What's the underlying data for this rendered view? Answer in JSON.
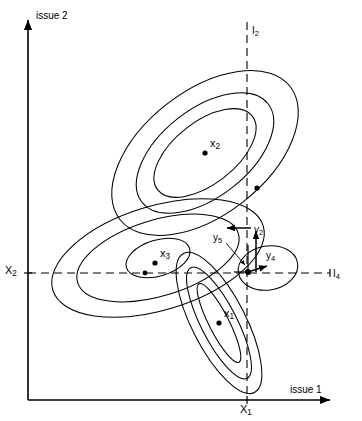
{
  "figure": {
    "background": "#ffffff",
    "ink": "#000000",
    "width": 362,
    "height": 421
  },
  "axes": {
    "x_label": "issue 1",
    "y_label": "issue 2",
    "x_axis_y": 400,
    "y_axis_x": 28,
    "origin": [
      28,
      400
    ],
    "x_arrow_end": [
      335,
      400
    ],
    "y_arrow_top": [
      28,
      15
    ]
  },
  "ticks": [
    {
      "name": "x1-tick",
      "label": "X",
      "sub": "1",
      "axis": "x",
      "pos": [
        247,
        400
      ]
    },
    {
      "name": "x2-tick",
      "label": "X",
      "sub": "2",
      "axis": "y",
      "pos": [
        28,
        273
      ]
    }
  ],
  "reference_lines": [
    {
      "name": "I2",
      "label": "I",
      "sub": "2",
      "orientation": "vertical",
      "x": 247,
      "y_from": 22,
      "y_to": 395,
      "style": "dashed",
      "label_pos": [
        253,
        30
      ]
    },
    {
      "name": "I4",
      "label": "I",
      "sub": "4",
      "orientation": "horizontal",
      "y": 273,
      "x_from": 28,
      "x_to": 330,
      "style": "dashed",
      "label_pos": [
        324,
        276
      ]
    }
  ],
  "points": [
    {
      "name": "x1",
      "label": "x",
      "sub": "1",
      "cx": 219,
      "cy": 323,
      "label_pos": [
        224,
        312
      ]
    },
    {
      "name": "x2",
      "label": "x",
      "sub": "2",
      "cx": 205,
      "cy": 153,
      "label_pos": [
        210,
        142
      ]
    },
    {
      "name": "x3",
      "label": "x",
      "sub": "3",
      "cx": 155,
      "cy": 263,
      "label_pos": [
        160,
        252
      ]
    },
    {
      "name": "node-upper-dash",
      "label": "",
      "sub": "",
      "cx": 257,
      "cy": 188,
      "label_pos": [
        0,
        0
      ]
    },
    {
      "name": "node-x3-on-I4",
      "label": "",
      "sub": "",
      "cx": 145,
      "cy": 273,
      "label_pos": [
        0,
        0
      ]
    },
    {
      "name": "node-center",
      "label": "",
      "sub": "",
      "cx": 248,
      "cy": 272,
      "label_pos": [
        0,
        0
      ]
    }
  ],
  "vectors": [
    {
      "name": "y2",
      "label": "y",
      "sub": "2",
      "from": [
        251,
        228
      ],
      "to": [
        228,
        228
      ],
      "label_pos": [
        255,
        228
      ]
    },
    {
      "name": "y4",
      "label": "y",
      "sub": "4",
      "from": [
        248,
        272
      ],
      "to": [
        268,
        266
      ],
      "label_pos": [
        268,
        258
      ]
    },
    {
      "name": "y5",
      "label": "y",
      "sub": "5",
      "from": [
        228,
        240
      ],
      "to": [
        246,
        264
      ],
      "label_pos": [
        220,
        240
      ]
    },
    {
      "name": "y-up",
      "label": "",
      "sub": "",
      "from": [
        256,
        272
      ],
      "to": [
        256,
        232
      ],
      "label_pos": [
        0,
        0
      ]
    }
  ],
  "clusters": [
    {
      "name": "cluster-x2",
      "center": [
        205,
        153
      ],
      "rotation": -38,
      "rings": [
        {
          "rx": 108,
          "ry": 62
        },
        {
          "rx": 80,
          "ry": 44
        },
        {
          "rx": 60,
          "ry": 31
        }
      ]
    },
    {
      "name": "cluster-x3",
      "center": [
        158,
        258
      ],
      "rotation": -17,
      "rings": [
        {
          "rx": 110,
          "ry": 52
        },
        {
          "rx": 84,
          "ry": 38
        },
        {
          "rx": 33,
          "ry": 18
        }
      ]
    },
    {
      "name": "cluster-x1",
      "center": [
        219,
        323
      ],
      "rotation": 63,
      "rings": [
        {
          "rx": 78,
          "ry": 27
        },
        {
          "rx": 62,
          "ry": 18
        },
        {
          "rx": 44,
          "ry": 10
        }
      ]
    },
    {
      "name": "cluster-right-small",
      "center": [
        268,
        268
      ],
      "rotation": -10,
      "rings": [
        {
          "rx": 30,
          "ry": 22
        }
      ]
    }
  ]
}
